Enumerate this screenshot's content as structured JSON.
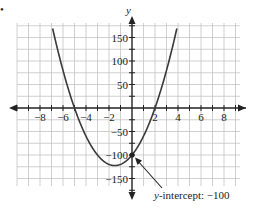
{
  "bullet": "•",
  "chart_data": {
    "type": "line",
    "title": "",
    "xlabel": "",
    "ylabel": "y",
    "xlim": [
      -9.5,
      9.5
    ],
    "ylim": [
      -175,
      175
    ],
    "grid": true,
    "x_ticks": [
      -8,
      -6,
      -4,
      -2,
      2,
      4,
      6,
      8
    ],
    "x_tick_labels": [
      "−8",
      "−6",
      "−4",
      "−2",
      "2",
      "4",
      "6",
      "8"
    ],
    "y_ticks": [
      150,
      100,
      50,
      -50,
      -100,
      -150
    ],
    "y_tick_labels": [
      "150",
      "100",
      "50",
      "−50",
      "−100",
      "−150"
    ],
    "series": [
      {
        "name": "parabola",
        "equation": "y = 10(x + 5)(x − 2)",
        "x": [
          -6.9,
          -6,
          -5,
          -4,
          -3,
          -2,
          -1.5,
          -1,
          0,
          1,
          2,
          3,
          3.9
        ],
        "values": [
          172,
          80,
          0,
          -60,
          -100,
          -120,
          -122.5,
          -120,
          -100,
          -60,
          0,
          80,
          172
        ]
      }
    ],
    "annotations": [
      {
        "text": "y-intercept: −100",
        "point": [
          0,
          -100
        ]
      }
    ],
    "x_intercepts": [
      -5,
      2
    ],
    "y_intercept": -100,
    "vertex": [
      -1.5,
      -122.5
    ]
  },
  "labels": {
    "y_axis": "y",
    "annotation_italic": "y",
    "annotation_rest": "-intercept: −100"
  }
}
